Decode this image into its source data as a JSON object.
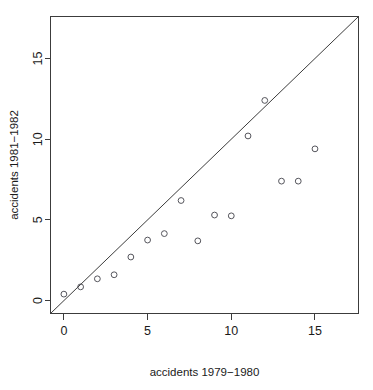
{
  "chart_data": {
    "type": "scatter",
    "title": "",
    "xlabel": "accidents 1979−1980",
    "ylabel": "accidents 1981−1982",
    "xlim": [
      -0.8,
      17.6
    ],
    "ylim": [
      -0.8,
      17.6
    ],
    "grid": false,
    "legend": null,
    "xticks": [
      0,
      5,
      10,
      15
    ],
    "yticks": [
      0,
      5,
      10,
      15
    ],
    "xticklabels": [
      "0",
      "5",
      "10",
      "15"
    ],
    "yticklabels": [
      "0",
      "5",
      "10",
      "15"
    ],
    "marker": "open-circle",
    "marker_color": "#55555c",
    "reference_line": {
      "name": "identity-line",
      "equation": "y = x",
      "from": [
        -0.8,
        -0.8
      ],
      "to": [
        17.6,
        17.6
      ],
      "color": "#3c3c3c"
    },
    "points": [
      {
        "x": 0,
        "y": 0.4
      },
      {
        "x": 1,
        "y": 0.85
      },
      {
        "x": 2,
        "y": 1.35
      },
      {
        "x": 3,
        "y": 1.6
      },
      {
        "x": 4,
        "y": 2.7
      },
      {
        "x": 5,
        "y": 3.75
      },
      {
        "x": 6,
        "y": 4.15
      },
      {
        "x": 7,
        "y": 6.2
      },
      {
        "x": 8,
        "y": 3.7
      },
      {
        "x": 9,
        "y": 5.3
      },
      {
        "x": 10,
        "y": 5.25
      },
      {
        "x": 11,
        "y": 10.2
      },
      {
        "x": 12,
        "y": 12.4
      },
      {
        "x": 13,
        "y": 7.4
      },
      {
        "x": 14,
        "y": 7.4
      },
      {
        "x": 15,
        "y": 9.4
      }
    ]
  },
  "caption": {
    "fragment": ""
  }
}
